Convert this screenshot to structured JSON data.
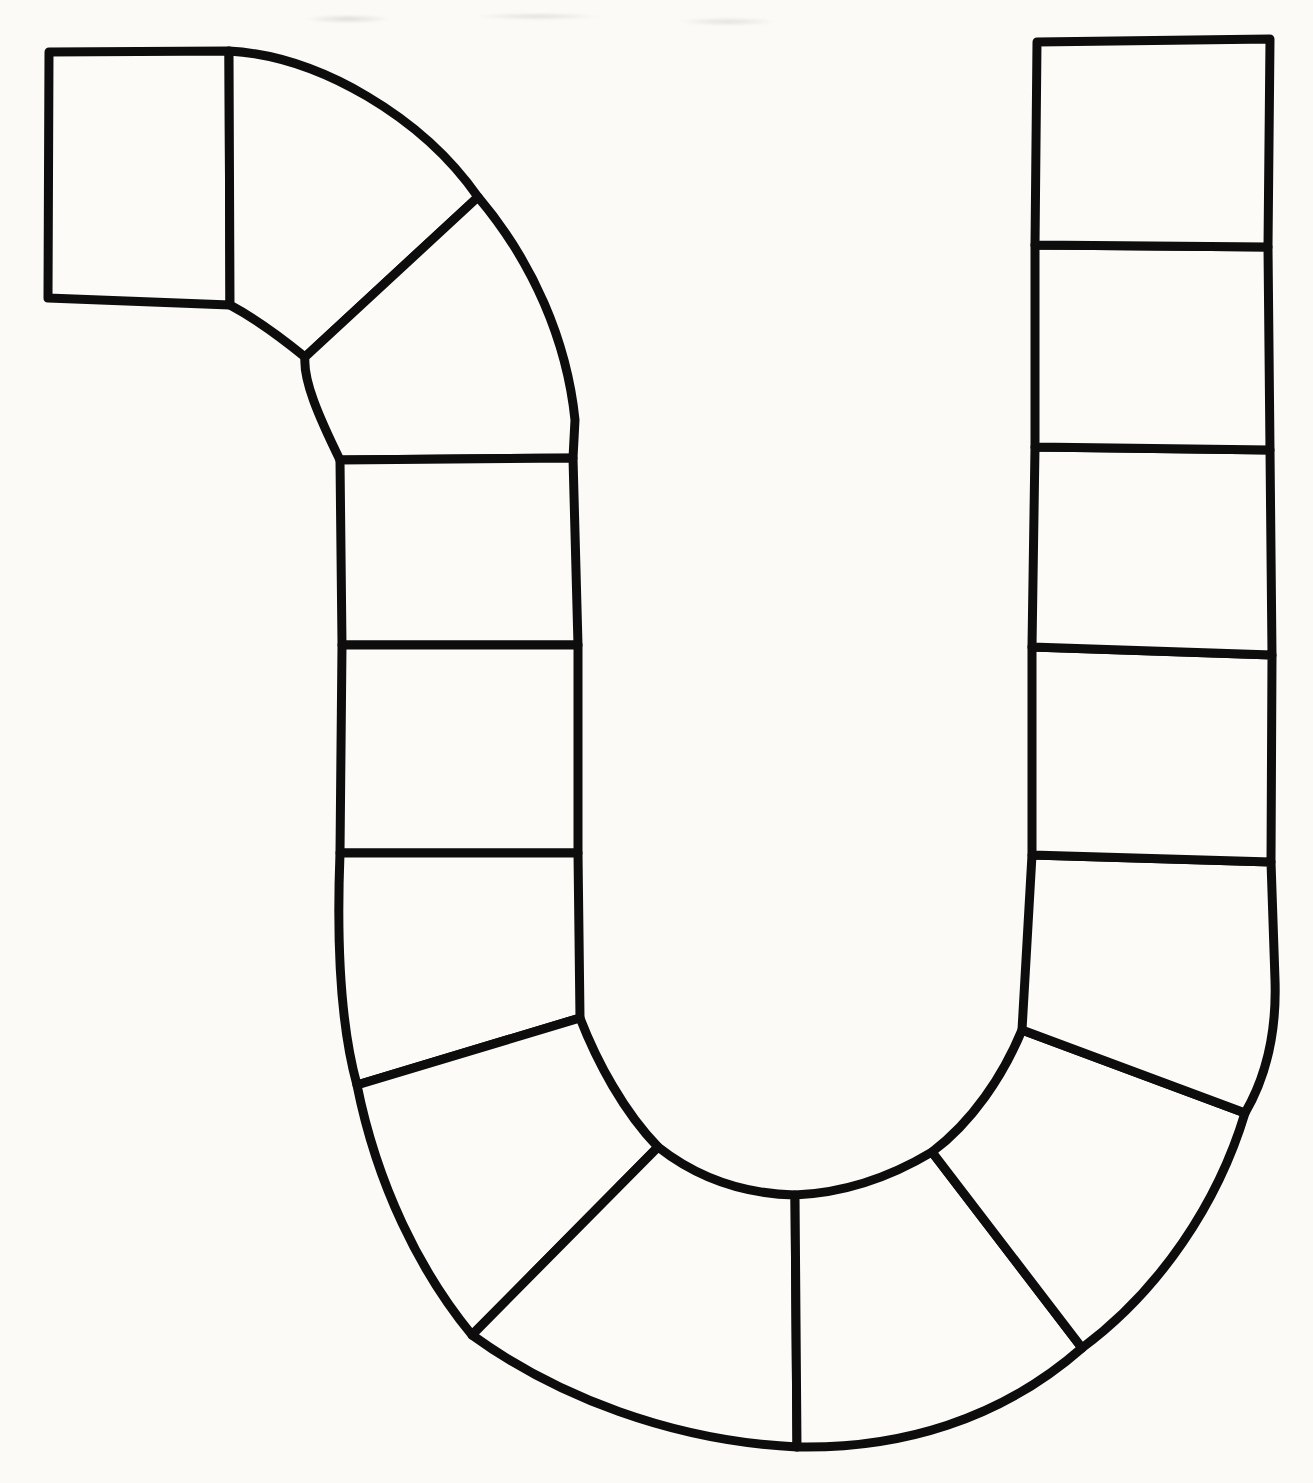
{
  "page": {
    "width": 1313,
    "height": 1483,
    "paper_color": "#fbfaf7",
    "ink_color": "#0d0d0d",
    "stroke_width": 9
  },
  "board": {
    "cell_count": 15,
    "sections": [
      {
        "name": "start-square",
        "cells": 1
      },
      {
        "name": "top-left-curve",
        "cells": 2
      },
      {
        "name": "left-column",
        "cells": 3
      },
      {
        "name": "bottom-u-bend",
        "cells": 4
      },
      {
        "name": "right-column",
        "cells": 5
      }
    ],
    "cells": [
      {
        "id": "cell-01-start-square",
        "section": "start-square",
        "d": "M 49 52 L 229 51 L 230 305 L 48 298 Z"
      },
      {
        "id": "cell-02-curve-upper",
        "section": "top-left-curve",
        "d": "M 229 51 C 320 56 423 118 478 197 L 305 357 C 272 330 243 312 230 305 Z"
      },
      {
        "id": "cell-03-curve-lower",
        "section": "top-left-curve",
        "d": "M 478 197 L 305 357 C 303 380 318 415 340 460 L 573 458 L 575 420 C 567 341 533 262 478 197 Z"
      },
      {
        "id": "cell-04-left-col-1",
        "section": "left-column",
        "d": "M 340 460 L 573 458 L 578 645 L 342 645 Z"
      },
      {
        "id": "cell-05-left-col-2",
        "section": "left-column",
        "d": "M 342 645 L 578 645 L 578 853 L 340 853 Z"
      },
      {
        "id": "cell-06-left-col-3",
        "section": "left-column",
        "d": "M 340 853 L 578 853 L 580 1018 L 357 1085 C 339 1020 337 930 340 853 Z"
      },
      {
        "id": "cell-07-ubend-1",
        "section": "bottom-u-bend",
        "d": "M 357 1085 L 580 1018 C 597 1062 624 1112 658 1147 L 472 1335 C 420 1272 377 1185 357 1085 Z"
      },
      {
        "id": "cell-08-ubend-2",
        "section": "bottom-u-bend",
        "d": "M 472 1335 L 658 1147 C 700 1180 748 1194 795 1195 L 797 1447 C 672 1441 556 1396 472 1335 Z"
      },
      {
        "id": "cell-09-ubend-3",
        "section": "bottom-u-bend",
        "d": "M 797 1447 L 795 1195 C 844 1193 892 1176 932 1152 L 1082 1348 C 1000 1420 900 1449 797 1447 Z"
      },
      {
        "id": "cell-10-ubend-4",
        "section": "bottom-u-bend",
        "d": "M 932 1152 C 972 1122 1003 1076 1022 1030 L 1245 1113 C 1218 1203 1160 1290 1082 1348 Z"
      },
      {
        "id": "cell-11-right-col-5",
        "section": "right-column",
        "d": "M 1032 855 L 1271 862 L 1275 980 C 1277 1040 1263 1082 1245 1113 L 1022 1030 Z"
      },
      {
        "id": "cell-12-right-col-4",
        "section": "right-column",
        "d": "M 1032 647 L 1272 655 L 1271 862 L 1032 855 Z"
      },
      {
        "id": "cell-13-right-col-3",
        "section": "right-column",
        "d": "M 1035 447 L 1270 450 L 1272 655 L 1032 647 Z"
      },
      {
        "id": "cell-14-right-col-2",
        "section": "right-column",
        "d": "M 1035 245 L 1268 247 L 1270 450 L 1035 447 Z"
      },
      {
        "id": "cell-15-right-col-1",
        "section": "right-column",
        "d": "M 1037 42 L 1270 39 L 1268 247 L 1035 245 Z"
      }
    ]
  }
}
